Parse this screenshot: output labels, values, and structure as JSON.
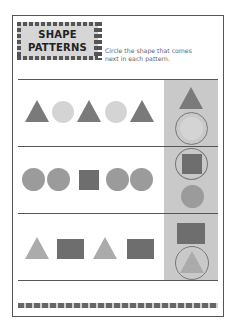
{
  "worksheet": {
    "title_line1": "SHAPE",
    "title_line2": "PATTERNS",
    "instruction_line1": "Circle the shape that comes",
    "instruction_line2": "next in each pattern."
  },
  "colors": {
    "dark_shape": "#7a7a7a",
    "light_shape": "#d4d4d4",
    "medium_shape": "#9b9b9b",
    "panel": "#c9c9c9",
    "border": "#555555"
  },
  "rows": [
    {
      "pattern": [
        "triangle-dark",
        "circle-light",
        "triangle-dark",
        "circle-light",
        "triangle-dark"
      ],
      "choices": [
        "triangle-dark",
        "circle-light"
      ],
      "circled_choice": 1
    },
    {
      "pattern": [
        "circle-medium",
        "circle-medium",
        "square-dark",
        "circle-medium",
        "circle-medium"
      ],
      "choices": [
        "square-dark",
        "circle-medium"
      ],
      "circled_choice": 0
    },
    {
      "pattern": [
        "triangle-light",
        "rectangle-dark",
        "triangle-light",
        "rectangle-dark"
      ],
      "choices": [
        "rectangle-dark",
        "triangle-light"
      ],
      "circled_choice": 1
    }
  ]
}
